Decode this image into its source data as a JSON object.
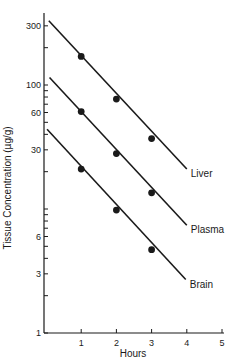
{
  "chart_data": {
    "type": "line",
    "title": "",
    "xlabel": "Hours",
    "ylabel": "Tissue Concentration (µg/g)",
    "yscale": "log",
    "xlim": [
      0,
      5
    ],
    "ylim": [
      1,
      400
    ],
    "grid": false,
    "legend_position": "inline-right-end-of-lines",
    "x_ticks": [
      1,
      2,
      3,
      4,
      5
    ],
    "y_tick_labels": [
      {
        "value": 1,
        "label": "1"
      },
      {
        "value": 3,
        "label": "3"
      },
      {
        "value": 6,
        "label": "6"
      },
      {
        "value": 30,
        "label": "30"
      },
      {
        "value": 60,
        "label": "60"
      },
      {
        "value": 100,
        "label": "100"
      },
      {
        "value": 300,
        "label": "300"
      }
    ],
    "y_minor_ticks": [
      2,
      4,
      5,
      7,
      8,
      9,
      10,
      20,
      40,
      50,
      70,
      80,
      90,
      200
    ],
    "series": [
      {
        "name": "Liver",
        "line_start": {
          "x": 0.08,
          "y": 330
        },
        "line_end": {
          "x": 4.0,
          "y": 21
        },
        "points": [
          {
            "x": 1,
            "y": 170
          },
          {
            "x": 2,
            "y": 77
          },
          {
            "x": 3,
            "y": 37
          }
        ]
      },
      {
        "name": "Plasma",
        "line_start": {
          "x": 0.1,
          "y": 115
        },
        "line_end": {
          "x": 4.0,
          "y": 7.4
        },
        "points": [
          {
            "x": 1,
            "y": 61
          },
          {
            "x": 2,
            "y": 28
          },
          {
            "x": 3,
            "y": 13.5
          }
        ]
      },
      {
        "name": "Brain",
        "line_start": {
          "x": 0.03,
          "y": 44
        },
        "line_end": {
          "x": 3.97,
          "y": 2.7
        },
        "points": [
          {
            "x": 1,
            "y": 21
          },
          {
            "x": 2,
            "y": 9.8
          },
          {
            "x": 3,
            "y": 4.7
          }
        ]
      }
    ]
  },
  "colors": {
    "ink": "#1a1a1a",
    "background": "#ffffff"
  }
}
